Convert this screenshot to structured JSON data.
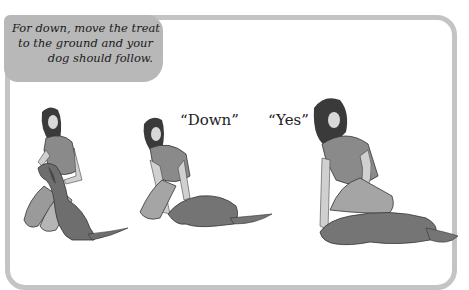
{
  "caption": {
    "lines": [
      "For down, move the treat",
      "to the ground and your",
      "dog should follow."
    ]
  },
  "panels": [
    {
      "step": 1,
      "quote": "",
      "description": "woman kneeling holding treat at sitting dog's nose"
    },
    {
      "step": 2,
      "quote": "“Down”",
      "description": "woman lowering treat to ground, dog following down"
    },
    {
      "step": 3,
      "quote": "“Yes”",
      "description": "woman praising dog lying down flat"
    }
  ],
  "colors": {
    "frame": "#c4c4c4",
    "callout_bg": "#b8b8b8",
    "figure_dark": "#3a3a3a",
    "figure_mid": "#8a8a8a",
    "figure_light": "#bdbdbd"
  }
}
